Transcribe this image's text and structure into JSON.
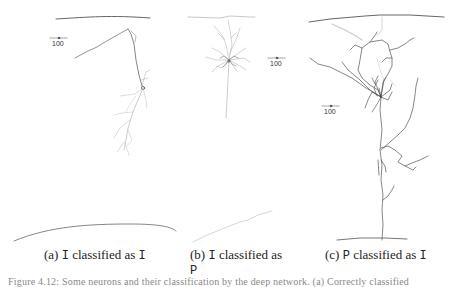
{
  "panels": [
    {
      "id": "a",
      "label": "(a)",
      "true_class": "I",
      "connector": "classified as",
      "predicted_class": "I",
      "scale_bar_label": "100"
    },
    {
      "id": "b",
      "label": "(b)",
      "true_class": "I",
      "connector": "classified as",
      "predicted_class": "P",
      "scale_bar_label": "100"
    },
    {
      "id": "c",
      "label": "(c)",
      "true_class": "P",
      "connector": "classified as",
      "predicted_class": "I",
      "scale_bar_label": "100"
    }
  ],
  "figure_caption": "Figure 4.12: Some neurons and their classification by the deep network. (a) Correctly classified"
}
